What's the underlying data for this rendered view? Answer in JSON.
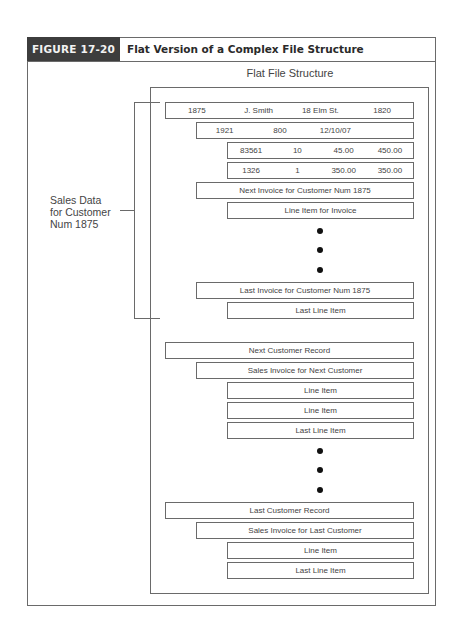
{
  "figure": {
    "label": "FIGURE 17-20",
    "title": "Flat Version of a Complex File Structure",
    "colors": {
      "header_bg": "#3d3d3d",
      "line": "#6a6a6a",
      "text": "#444444"
    }
  },
  "diagram": {
    "subtitle": "Flat File Structure",
    "bracket_label": [
      "Sales Data",
      "for Customer",
      "Num 1875"
    ],
    "customer_record": [
      "1875",
      "J. Smith",
      "18 Elm St.",
      "1820"
    ],
    "invoice_record": [
      "1921",
      "800",
      "12/10/07"
    ],
    "line_items": [
      [
        "83561",
        "10",
        "45.00",
        "450.00"
      ],
      [
        "1326",
        "1",
        "350.00",
        "350.00"
      ]
    ],
    "rows": {
      "next_invoice": "Next Invoice for Customer Num 1875",
      "line_item_for_invoice": "Line Item for Invoice",
      "last_invoice": "Last Invoice for Customer Num 1875",
      "last_line_item_1": "Last Line Item",
      "next_customer_record": "Next Customer Record",
      "sales_invoice_next": "Sales Invoice for Next Customer",
      "line_item_a": "Line Item",
      "line_item_b": "Line Item",
      "last_line_item_2": "Last Line Item",
      "last_customer_record": "Last Customer Record",
      "sales_invoice_last": "Sales Invoice for Last Customer",
      "line_item_c": "Line Item",
      "last_line_item_3": "Last Line Item"
    },
    "ellipsis_marker": "•"
  }
}
